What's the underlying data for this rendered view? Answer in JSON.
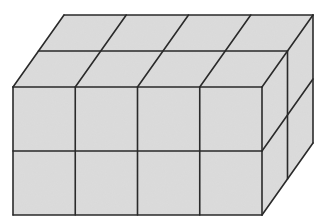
{
  "figure": {
    "dimensions": {
      "length": 4,
      "depth": 2,
      "height": 2
    },
    "cube_count": 16,
    "colors": {
      "face": "#dcdcdc",
      "edge": "#2a2a2a",
      "background": "#ffffff"
    },
    "geometry": {
      "front": {
        "x0": 13,
        "x1": 262,
        "y0": 87,
        "y1": 215
      },
      "depth_offset": {
        "dx": 51,
        "dy": -72
      }
    }
  }
}
